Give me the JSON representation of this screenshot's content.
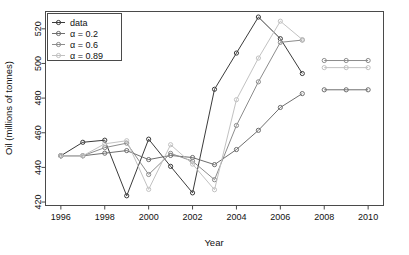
{
  "chart_data": {
    "type": "line",
    "title": "",
    "xlabel": "Year",
    "ylabel": "Oil (millions of tonnes)",
    "xlim": [
      1995.3,
      2010.7
    ],
    "ylim": [
      418,
      530
    ],
    "xticks": [
      1996,
      1998,
      2000,
      2002,
      2004,
      2006,
      2008,
      2010
    ],
    "yticks": [
      420,
      440,
      460,
      480,
      500,
      520
    ],
    "grid": false,
    "legend_position": "top-left",
    "legend_entries": [
      "data",
      "α = 0.2",
      "α = 0.6",
      "α = 0.89"
    ],
    "series": [
      {
        "name": "data",
        "color": "#3b3b3b",
        "x": [
          1996,
          1997,
          1998,
          1999,
          2000,
          2001,
          2002,
          2003,
          2004,
          2005,
          2006,
          2007
        ],
        "values": [
          446.7,
          454.5,
          455.7,
          423.6,
          456.3,
          440.6,
          425.3,
          485.1,
          506.0,
          526.8,
          514.3,
          494.2
        ]
      },
      {
        "name": "α = 0.2",
        "color": "#6e6e6e",
        "x": [
          1996,
          1997,
          1998,
          1999,
          2000,
          2001,
          2002,
          2003,
          2004,
          2005,
          2006,
          2007
        ],
        "values": [
          446.7,
          446.7,
          448.2,
          449.7,
          444.5,
          446.9,
          445.7,
          441.6,
          450.3,
          461.4,
          474.6,
          482.6
        ],
        "forecast_x": [
          2008,
          2009,
          2010
        ],
        "forecast_values": [
          484.8,
          484.8,
          484.8
        ]
      },
      {
        "name": "α = 0.6",
        "color": "#8c8c8c",
        "x": [
          1996,
          1997,
          1998,
          1999,
          2000,
          2001,
          2002,
          2003,
          2004,
          2005,
          2006,
          2007
        ],
        "values": [
          446.7,
          446.7,
          451.4,
          454.0,
          435.9,
          448.1,
          443.6,
          432.9,
          464.2,
          489.4,
          512.2,
          513.5
        ],
        "forecast_x": [
          2008,
          2009,
          2010
        ],
        "forecast_values": [
          501.7,
          501.7,
          501.7
        ]
      },
      {
        "name": "α = 0.89",
        "color": "#c2c2c2",
        "x": [
          1996,
          1997,
          1998,
          1999,
          2000,
          2001,
          2002,
          2003,
          2004,
          2005,
          2006,
          2007
        ],
        "values": [
          446.7,
          446.7,
          453.6,
          455.4,
          427.3,
          453.1,
          441.9,
          427.1,
          479.1,
          503.1,
          524.4,
          513.8
        ],
        "forecast_x": [
          2008,
          2009,
          2010
        ],
        "forecast_values": [
          497.6,
          497.6,
          497.6
        ]
      }
    ]
  },
  "axes": {
    "x_label": "Year",
    "y_label": "Oil (millions of tonnes)",
    "x_tick_labels": [
      "1996",
      "1998",
      "2000",
      "2002",
      "2004",
      "2006",
      "2008",
      "2010"
    ],
    "y_tick_labels": [
      "420",
      "440",
      "460",
      "480",
      "500",
      "520"
    ]
  },
  "legend": {
    "items": [
      {
        "label": "data",
        "color": "#3b3b3b"
      },
      {
        "label": "α = 0.2",
        "color": "#6e6e6e"
      },
      {
        "label": "α = 0.6",
        "color": "#8c8c8c"
      },
      {
        "label": "α = 0.89",
        "color": "#c2c2c2"
      }
    ]
  }
}
